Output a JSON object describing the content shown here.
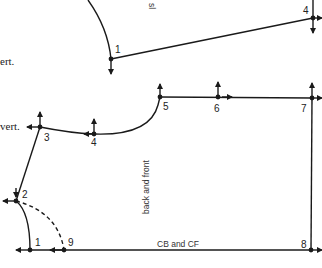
{
  "diagram": {
    "type": "garment pattern draft",
    "colors": {
      "line": "#1a1a1a",
      "background": "#ffffff"
    },
    "annotations": {
      "vert_top": "ert.",
      "vert_bottom": "vert.",
      "sleeve_label": "sl",
      "body_label": "back and front",
      "base_label": "CB and CF"
    },
    "sleeve_points": [
      {
        "id": "s1",
        "label": "1"
      },
      {
        "id": "s4",
        "label": "4"
      }
    ],
    "body_points": [
      {
        "id": "b1",
        "label": "1"
      },
      {
        "id": "b2",
        "label": "2"
      },
      {
        "id": "b3",
        "label": "3"
      },
      {
        "id": "b4",
        "label": "4"
      },
      {
        "id": "b5",
        "label": "5"
      },
      {
        "id": "b6",
        "label": "6"
      },
      {
        "id": "b7",
        "label": "7"
      },
      {
        "id": "b8",
        "label": "8"
      },
      {
        "id": "b9",
        "label": "9"
      }
    ]
  }
}
